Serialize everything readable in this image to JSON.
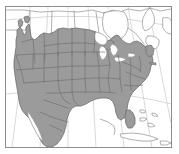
{
  "figure": {
    "title": "Map of North America with contiguous United States highlighted",
    "type": "choropleth-outline-map",
    "region": "North America",
    "projection": "conic",
    "width": 179,
    "height": 154
  },
  "frame": {
    "visible": true,
    "stroke_color": "#8c8c8c",
    "stroke_width": 1,
    "fill_color": "#ffffff",
    "x": 5,
    "y": 6,
    "width": 167,
    "height": 142
  },
  "colors": {
    "background": "#ffffff",
    "ocean": "#ffffff",
    "highlight_fill": "#9b9b9b",
    "highlight_fill_alt": "#a3a3a3",
    "unhighlighted_fill": "#ffffff",
    "internal_boundary": "#6e6e6e",
    "coastline": "#7d7d7d",
    "graticule": "#c9c9c9",
    "frame": "#8c8c8c"
  },
  "legend": {
    "visible": false,
    "entries": [
      {
        "label": "Highlighted area",
        "color": "#9b9b9b"
      },
      {
        "label": "Other land",
        "color": "#ffffff"
      }
    ]
  },
  "graticule": {
    "visible": true,
    "color": "#c9c9c9",
    "meridian_count": 7,
    "parallel_count": 2,
    "labels_visible": false
  },
  "layers": [
    {
      "name": "graticule",
      "visible": true
    },
    {
      "name": "coastlines",
      "visible": true
    },
    {
      "name": "country-boundaries",
      "visible": true
    },
    {
      "name": "state-boundaries",
      "visible": true
    },
    {
      "name": "highlight-fill",
      "visible": true
    },
    {
      "name": "lakes",
      "visible": true
    }
  ],
  "features": {
    "highlighted_regions": [
      "Contiguous United States",
      "Mexico"
    ],
    "unhighlighted_regions": [
      "Canada",
      "Cuba",
      "Hispaniola",
      "Bahamas"
    ],
    "water_bodies": [
      "Pacific Ocean",
      "Atlantic Ocean",
      "Gulf of Mexico",
      "Great Lakes",
      "Hudson Bay",
      "Gulf of California"
    ]
  },
  "axes": {
    "visible": false,
    "tick_labels": []
  },
  "chart_data": {
    "type": "map",
    "title": "Map of North America with contiguous United States highlighted",
    "categories": [
      "Highlighted",
      "Not highlighted"
    ],
    "values": [
      1,
      0
    ],
    "xlabel": "",
    "ylabel": "",
    "legend_position": "none",
    "grid": true
  }
}
